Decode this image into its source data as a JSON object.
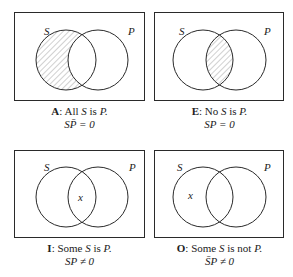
{
  "colors": {
    "stroke": "#2a2a2a",
    "hatch": "#8a8a8a",
    "background": "#ffffff"
  },
  "panels": [
    {
      "id": "A",
      "letter": "A",
      "statement_pre": ": All ",
      "statement_s": "S",
      "statement_mid": " is ",
      "statement_p": "P.",
      "formula": "SP̄ = 0",
      "shaded": "s-only",
      "x_mark": "",
      "label_s": "S",
      "label_p": "P"
    },
    {
      "id": "E",
      "letter": "E",
      "statement_pre": ": No ",
      "statement_s": "S",
      "statement_mid": " is ",
      "statement_p": "P.",
      "formula": "SP = 0",
      "shaded": "intersection",
      "x_mark": "",
      "label_s": "S",
      "label_p": "P"
    },
    {
      "id": "I",
      "letter": "I",
      "statement_pre": ": Some ",
      "statement_s": "S",
      "statement_mid": " is ",
      "statement_p": "P.",
      "formula": "SP ≠ 0",
      "shaded": "none",
      "x_mark": "x",
      "label_s": "S",
      "label_p": "P"
    },
    {
      "id": "O",
      "letter": "O",
      "statement_pre": ": Some ",
      "statement_s": "S",
      "statement_mid": " is not ",
      "statement_p": "P.",
      "formula": "S̄P ≠ 0",
      "shaded": "none",
      "x_mark": "x",
      "label_s": "S",
      "label_p": "P"
    }
  ]
}
